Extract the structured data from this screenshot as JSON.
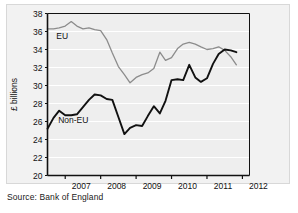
{
  "figure": {
    "source_note": "Source: Bank of England",
    "y_axis_title": "£ billions",
    "eu_label": "EU",
    "noneu_label": "Non-EU",
    "eu_color": "#8c8c8c",
    "noneu_color": "#111111",
    "plot_bg": "#eeeeee",
    "gridline_color": "#ffffff",
    "frame_color": "#111111"
  },
  "chart_data": {
    "type": "line",
    "title": "",
    "xlabel": "",
    "ylabel": "£ billions",
    "ylim": [
      20,
      38
    ],
    "xlim": [
      2006.5,
      2012.2
    ],
    "yticks": [
      20,
      22,
      24,
      26,
      28,
      30,
      32,
      34,
      36,
      38
    ],
    "ytick_labels": [
      "20",
      "22",
      "24",
      "26",
      "28",
      "30",
      "32",
      "34",
      "36",
      "38"
    ],
    "xticks": [
      2007,
      2008,
      2009,
      2010,
      2011,
      2012
    ],
    "xtick_labels": [
      "2007",
      "2008",
      "2009",
      "2010",
      "2011",
      "2012"
    ],
    "grid": "horizontal",
    "legend": "inline-labels",
    "series": [
      {
        "name": "EU",
        "color": "#8c8c8c",
        "x": [
          2006.5,
          2006.67,
          2006.83,
          2007.0,
          2007.17,
          2007.33,
          2007.5,
          2007.67,
          2007.83,
          2008.0,
          2008.17,
          2008.33,
          2008.5,
          2008.67,
          2008.83,
          2009.0,
          2009.17,
          2009.33,
          2009.5,
          2009.67,
          2009.83,
          2010.0,
          2010.17,
          2010.33,
          2010.5,
          2010.67,
          2010.83,
          2011.0,
          2011.17,
          2011.33,
          2011.5,
          2011.67,
          2011.83
        ],
        "values": [
          36.3,
          36.3,
          36.4,
          36.6,
          37.1,
          36.6,
          36.3,
          36.4,
          36.2,
          36.1,
          35.1,
          33.6,
          32.1,
          31.2,
          30.3,
          30.9,
          31.2,
          31.4,
          31.9,
          33.7,
          32.8,
          33.1,
          34.1,
          34.6,
          34.8,
          34.6,
          34.3,
          34.0,
          34.1,
          34.3,
          33.9,
          33.2,
          32.3
        ]
      },
      {
        "name": "Non-EU",
        "color": "#111111",
        "x": [
          2006.5,
          2006.67,
          2006.83,
          2007.0,
          2007.17,
          2007.33,
          2007.5,
          2007.67,
          2007.83,
          2008.0,
          2008.17,
          2008.33,
          2008.5,
          2008.67,
          2008.83,
          2009.0,
          2009.17,
          2009.33,
          2009.5,
          2009.67,
          2009.83,
          2010.0,
          2010.17,
          2010.33,
          2010.5,
          2010.67,
          2010.83,
          2011.0,
          2011.17,
          2011.33,
          2011.5,
          2011.67,
          2011.83
        ],
        "values": [
          25.2,
          26.4,
          27.2,
          26.7,
          26.7,
          26.8,
          27.6,
          28.4,
          29.0,
          28.9,
          28.5,
          28.4,
          26.5,
          24.6,
          25.3,
          25.6,
          25.5,
          26.6,
          27.7,
          26.9,
          28.3,
          30.6,
          30.7,
          30.6,
          32.3,
          30.9,
          30.4,
          30.8,
          32.4,
          33.5,
          34.0,
          33.9,
          33.7
        ]
      }
    ],
    "annotations": [
      {
        "text": "EU",
        "x": 2006.75,
        "y": 35.2
      },
      {
        "text": "Non-EU",
        "x": 2006.8,
        "y": 25.8
      }
    ]
  }
}
